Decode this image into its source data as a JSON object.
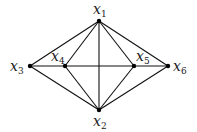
{
  "diagram": {
    "type": "graph",
    "nodes": [
      {
        "id": "x1",
        "var": "x",
        "sub": "1",
        "x": 99,
        "y": 21,
        "lx": 93,
        "ly": 14
      },
      {
        "id": "x2",
        "var": "x",
        "sub": "2",
        "x": 99,
        "y": 110,
        "lx": 93,
        "ly": 126
      },
      {
        "id": "x3",
        "var": "x",
        "sub": "3",
        "x": 30,
        "y": 66,
        "lx": 10,
        "ly": 71
      },
      {
        "id": "x4",
        "var": "x",
        "sub": "4",
        "x": 65,
        "y": 66,
        "lx": 51,
        "ly": 61
      },
      {
        "id": "x5",
        "var": "x",
        "sub": "5",
        "x": 134,
        "y": 66,
        "lx": 136,
        "ly": 61
      },
      {
        "id": "x6",
        "var": "x",
        "sub": "6",
        "x": 168,
        "y": 66,
        "lx": 173,
        "ly": 71
      }
    ],
    "edges": [
      [
        "x1",
        "x2"
      ],
      [
        "x1",
        "x3"
      ],
      [
        "x1",
        "x4"
      ],
      [
        "x1",
        "x5"
      ],
      [
        "x1",
        "x6"
      ],
      [
        "x2",
        "x3"
      ],
      [
        "x2",
        "x4"
      ],
      [
        "x2",
        "x5"
      ],
      [
        "x2",
        "x6"
      ],
      [
        "x3",
        "x6"
      ]
    ],
    "colors": {
      "edge": "#111111",
      "node": "#000000",
      "label": "#222222"
    }
  }
}
